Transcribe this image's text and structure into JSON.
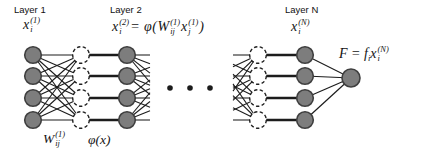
{
  "colors": {
    "background": "#ffffff",
    "node_fill": "#7d7d7d",
    "node_stroke": "#3f3f3f",
    "dashed_stroke": "#1f1f1f",
    "line": "#1c1c1c",
    "text": "#111111"
  },
  "layer_labels": {
    "layer1": "Layer 1",
    "layer2": "Layer 2",
    "layerN": "Layer N"
  },
  "formulas": {
    "x1": {
      "base": "x",
      "sub": "i",
      "sup": "(1)"
    },
    "layer2_lhs": {
      "base": "x",
      "sub": "i",
      "sup": "(2)"
    },
    "layer2_eq": "= φ(",
    "layer2_W": {
      "base": "W",
      "sub": "ij",
      "sup": "(1)"
    },
    "layer2_x": {
      "base": "x",
      "sub": "j",
      "sup": "(1)"
    },
    "layer2_close": ")",
    "xN": {
      "base": "x",
      "sub": "i",
      "sup": "(N)"
    },
    "output_lhs": "F = f",
    "output_lhs_sub": "i",
    "output_x": {
      "base": "x",
      "sub": "i",
      "sup": "(N)"
    },
    "weights": {
      "base": "W",
      "sub": "ij",
      "sup": "(1)"
    },
    "activation": "φ(x)"
  },
  "network": {
    "columns": [
      {
        "id": "layer1-nodes",
        "style": "solid",
        "count": 4
      },
      {
        "id": "layer1-sum-nodes",
        "style": "dashed",
        "count": 4
      },
      {
        "id": "layer2-nodes",
        "style": "solid",
        "count": 4
      },
      {
        "id": "layerN-sum-nodes",
        "style": "dashed",
        "count": 4
      },
      {
        "id": "layerN-nodes",
        "style": "solid",
        "count": 4
      }
    ],
    "output_nodes": 1,
    "ellipsis_dots": 3
  }
}
